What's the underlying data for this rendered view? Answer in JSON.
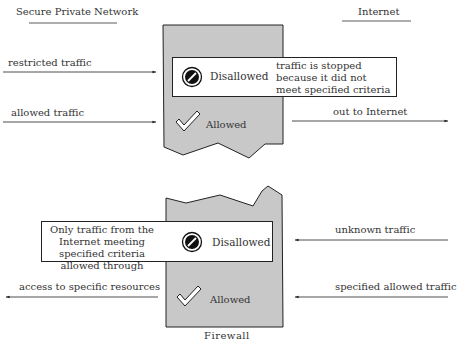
{
  "headings": {
    "left": "Secure Private Network",
    "right": "Internet",
    "bottom": "Firewall"
  },
  "top_firewall": {
    "inputs": [
      {
        "label": "restricted traffic",
        "direction": "right"
      },
      {
        "label": "allowed traffic",
        "direction": "right"
      }
    ],
    "output": {
      "label": "out to Internet",
      "direction": "right"
    },
    "disallowed_label": "Disallowed",
    "disallowed_note": "traffic is stopped because it did not meet specified criteria",
    "allowed_label": "Allowed"
  },
  "bottom_firewall": {
    "inputs": [
      {
        "label": "unknown traffic",
        "direction": "left"
      },
      {
        "label": "specified allowed traffic",
        "direction": "left"
      }
    ],
    "output": {
      "label": "access to specific resources",
      "direction": "left"
    },
    "disallowed_label": "Disallowed",
    "disallowed_note": "Only traffic from the Internet meeting specified criteria allowed through",
    "allowed_label": "Allowed"
  },
  "icons": {
    "disallowed": "no-entry-icon",
    "allowed": "checkmark-icon"
  },
  "colors": {
    "firewall_fill": "#c8c8c8",
    "stroke": "#222222",
    "background": "#ffffff"
  }
}
